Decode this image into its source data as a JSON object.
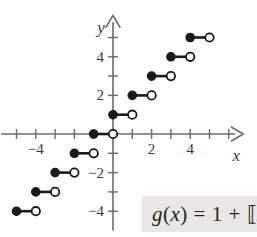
{
  "figure": {
    "type": "step-function-graph",
    "background": "#ffffff",
    "ink_color": "#1a1a1a",
    "axis_color": "#6b6b6b",
    "equation_box_color": "#e8e7e5"
  },
  "axes": {
    "x_label": "x",
    "y_label": "y",
    "origin_px": {
      "x": 113,
      "y": 134
    },
    "unit_px": 19.3,
    "x_range": [
      -5.8,
      6.8
    ],
    "y_range": [
      -5.0,
      6.2
    ],
    "x_tick_labels": [
      {
        "value": -4,
        "text": "−4"
      },
      {
        "value": 2,
        "text": "2"
      },
      {
        "value": 4,
        "text": "4"
      }
    ],
    "y_tick_labels": [
      {
        "value": 4,
        "text": "4"
      },
      {
        "value": 2,
        "text": "2"
      },
      {
        "value": -2,
        "text": "−2"
      },
      {
        "value": -4,
        "text": "−4"
      }
    ],
    "x_ticks": [
      -5,
      -4,
      -3,
      -2,
      -1,
      1,
      2,
      3,
      4,
      5,
      6
    ],
    "y_ticks": [
      -4,
      -3,
      -2,
      -1,
      1,
      2,
      3,
      4,
      5
    ],
    "grid": false
  },
  "equation": {
    "label": "g(x) = 1 + ⟦x⟧",
    "lhs": "g(x)",
    "rhs": "1 + ⟦x⟧",
    "truncated": true
  },
  "chart_data": {
    "type": "step",
    "title": "",
    "xlabel": "x",
    "ylabel": "y",
    "xlim": [
      -5.8,
      6.8
    ],
    "ylim": [
      -5.0,
      6.2
    ],
    "grid": false,
    "function": "g(x) = 1 + ⟦x⟧",
    "segments": [
      {
        "x_start": -5,
        "x_end": -4,
        "y": -4,
        "left_endpoint": "closed",
        "right_endpoint": "open"
      },
      {
        "x_start": -4,
        "x_end": -3,
        "y": -3,
        "left_endpoint": "closed",
        "right_endpoint": "open"
      },
      {
        "x_start": -3,
        "x_end": -2,
        "y": -2,
        "left_endpoint": "closed",
        "right_endpoint": "open"
      },
      {
        "x_start": -2,
        "x_end": -1,
        "y": -1,
        "left_endpoint": "closed",
        "right_endpoint": "open"
      },
      {
        "x_start": -1,
        "x_end": 0,
        "y": 0,
        "left_endpoint": "closed",
        "right_endpoint": "open"
      },
      {
        "x_start": 0,
        "x_end": 1,
        "y": 1,
        "left_endpoint": "closed",
        "right_endpoint": "open"
      },
      {
        "x_start": 1,
        "x_end": 2,
        "y": 2,
        "left_endpoint": "closed",
        "right_endpoint": "open"
      },
      {
        "x_start": 2,
        "x_end": 3,
        "y": 3,
        "left_endpoint": "closed",
        "right_endpoint": "open"
      },
      {
        "x_start": 3,
        "x_end": 4,
        "y": 4,
        "left_endpoint": "closed",
        "right_endpoint": "open"
      },
      {
        "x_start": 4,
        "x_end": 5,
        "y": 5,
        "left_endpoint": "closed",
        "right_endpoint": "open"
      }
    ]
  }
}
